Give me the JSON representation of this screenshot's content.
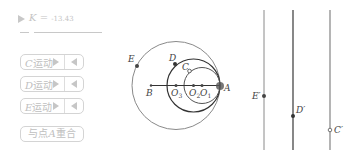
{
  "slider": {
    "name": "K",
    "value": "-13.43",
    "equals": "="
  },
  "buttons": [
    {
      "point": "C",
      "label": "运动",
      "forward_icon": "play-forward-icon",
      "back_icon": "play-backward-icon"
    },
    {
      "point": "D",
      "label": "运动",
      "forward_icon": "play-forward-icon",
      "back_icon": "play-backward-icon"
    },
    {
      "point": "E",
      "label": "运动",
      "forward_icon": "play-forward-icon",
      "back_icon": "play-backward-icon"
    }
  ],
  "reset_button": {
    "prefix": "与点",
    "point": "A",
    "suffix": "重合"
  },
  "diagram": {
    "points": {
      "A": "A",
      "B": "B",
      "C": "C",
      "D": "D",
      "E": "E",
      "O1": "O",
      "O1_sub": "1",
      "O2": "O",
      "O2_sub": "2",
      "O3": "O",
      "O3_sub": "3"
    },
    "colors": {
      "dark": "#333333",
      "light": "#8a8a8a",
      "point": "#444444"
    }
  },
  "projections": {
    "E_prime": "E′",
    "D_prime": "D′",
    "C_prime": "C′"
  }
}
